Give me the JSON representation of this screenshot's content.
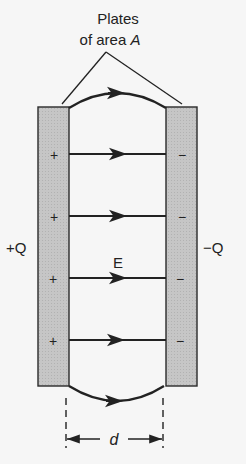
{
  "diagram": {
    "title_line1": "Plates",
    "title_line2": "of area ",
    "title_var": "A",
    "left_charge": "+Q",
    "right_charge": "−Q",
    "field_label": "E",
    "separation_label": "d",
    "plus_sign": "+",
    "minus_sign": "−",
    "colors": {
      "plate_fill": "#c4c4c4",
      "plate_stroke": "#2a2a2a",
      "line": "#222222",
      "background": "#f6f6f6"
    },
    "field_lines_count": 6
  }
}
